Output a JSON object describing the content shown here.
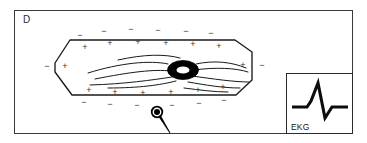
{
  "figure": {
    "panel_label": "D",
    "type": "diagram",
    "state_description": "polarized resting cardiac muscle cell with negative charges outside and positive charges inside"
  },
  "colors": {
    "background": "#ffffff",
    "frame_stroke": "#3a3a3a",
    "line_stroke": "#1a1a1a",
    "charge_sign": "#333333",
    "nucleus_fill": "#000000",
    "nucleus_highlight": "#ffffff",
    "electrode_fill": "#000000",
    "text": "#2b2b2b"
  },
  "cell": {
    "name": "cardiac-muscle-cell",
    "outline_points": "55,63 70,40 235,40 252,52 252,80 236,95 72,95 55,72",
    "myofibril_paths": [
      "M 88,73 C 120,63 150,60 168,64",
      "M 95,79 C 130,72 155,69 170,71",
      "M 90,85 C 125,84 152,80 172,77",
      "M 108,88 C 140,88 160,85 176,81",
      "M 196,64 C 214,60 232,62 246,68",
      "M 194,70 C 216,67 236,68 248,72",
      "M 192,76 C 214,79 234,82 249,82",
      "M 188,82 C 206,85 222,88 240,88",
      "M 118,60 C 145,54 165,54 180,58",
      "M 184,88 C 200,90 214,92 228,92"
    ],
    "nucleus": {
      "cx": 183,
      "cy": 70,
      "rx": 15.5,
      "ry": 9.5,
      "highlight_rx": 6.5,
      "highlight_ry": 3.6
    }
  },
  "charges": {
    "outer_sign": "−",
    "inner_sign": "+",
    "outer_label": "extracellular-negative-charge",
    "inner_label": "intracellular-positive-charge",
    "outer_top": [
      {
        "x": 80,
        "y": 36
      },
      {
        "x": 104,
        "y": 32
      },
      {
        "x": 131,
        "y": 30
      },
      {
        "x": 158,
        "y": 31
      },
      {
        "x": 186,
        "y": 32
      },
      {
        "x": 211,
        "y": 34
      }
    ],
    "outer_bottom": [
      {
        "x": 84,
        "y": 103
      },
      {
        "x": 110,
        "y": 105
      },
      {
        "x": 137,
        "y": 106
      },
      {
        "x": 172,
        "y": 106
      },
      {
        "x": 199,
        "y": 104
      },
      {
        "x": 224,
        "y": 101
      }
    ],
    "outer_sides": [
      {
        "x": 47,
        "y": 67
      },
      {
        "x": 262,
        "y": 66
      }
    ],
    "inner_top": [
      {
        "x": 85,
        "y": 48
      },
      {
        "x": 110,
        "y": 44
      },
      {
        "x": 138,
        "y": 43
      },
      {
        "x": 166,
        "y": 44
      },
      {
        "x": 193,
        "y": 45
      },
      {
        "x": 219,
        "y": 47
      }
    ],
    "inner_bottom": [
      {
        "x": 89,
        "y": 91
      },
      {
        "x": 115,
        "y": 93
      },
      {
        "x": 143,
        "y": 94
      },
      {
        "x": 171,
        "y": 93
      },
      {
        "x": 198,
        "y": 91
      },
      {
        "x": 223,
        "y": 88
      }
    ],
    "inner_sides": [
      {
        "x": 65,
        "y": 67
      },
      {
        "x": 243,
        "y": 66
      }
    ]
  },
  "electrode": {
    "name": "recording-electrode",
    "cx": 157,
    "cy": 112,
    "outer_r": 6.2,
    "ring_r": 4.4,
    "core_r": 3.0,
    "lead_path": "M 159,115 L 170,133",
    "lead_width_top": 2.6,
    "lead_width_bottom": 0.9
  },
  "ekg": {
    "label": "EKG",
    "trace_name": "ekg-qrs-waveform",
    "trace_path": "M 5,33 L 20,33 L 24,27 L 31,9 L 38,44 L 45,33 L 61,33",
    "description": "flat baseline, tall sharp R-wave upstroke, deep S-wave downstroke, return to baseline",
    "stroke_width": 3.1
  }
}
